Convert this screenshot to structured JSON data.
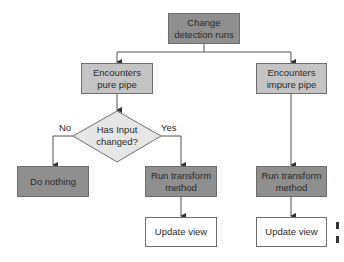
{
  "diagram": {
    "type": "flowchart",
    "nodes": {
      "start": {
        "label": "Change\ndetection runs",
        "line1": "Change",
        "line2": "detection runs",
        "shape": "rect",
        "fill": "#8f8f8f"
      },
      "pure": {
        "line1": "Encounters",
        "line2": "pure pipe",
        "shape": "rect",
        "fill": "#c4c4c4"
      },
      "impure": {
        "line1": "Encounters",
        "line2": "impure pipe",
        "shape": "rect",
        "fill": "#c4c4c4"
      },
      "decision": {
        "line1": "Has Input",
        "line2": "changed?",
        "shape": "diamond",
        "fill": "#e6e6e6"
      },
      "do_nothing": {
        "label": "Do nothing",
        "shape": "rect",
        "fill": "#8f8f8f"
      },
      "transform_pure": {
        "line1": "Run transform",
        "line2": "method",
        "shape": "rect",
        "fill": "#8f8f8f"
      },
      "update_pure": {
        "label": "Update view",
        "shape": "rect",
        "fill": "#ffffff"
      },
      "transform_impure": {
        "line1": "Run transform",
        "line2": "method",
        "shape": "rect",
        "fill": "#8f8f8f"
      },
      "update_impure": {
        "label": "Update view",
        "shape": "rect",
        "fill": "#ffffff"
      }
    },
    "edge_labels": {
      "no": "No",
      "yes": "Yes"
    },
    "edges": [
      {
        "from": "start",
        "to": "pure"
      },
      {
        "from": "start",
        "to": "impure"
      },
      {
        "from": "pure",
        "to": "decision"
      },
      {
        "from": "decision",
        "to": "do_nothing",
        "label": "No"
      },
      {
        "from": "decision",
        "to": "transform_pure",
        "label": "Yes"
      },
      {
        "from": "transform_pure",
        "to": "update_pure"
      },
      {
        "from": "impure",
        "to": "transform_impure"
      },
      {
        "from": "transform_impure",
        "to": "update_impure"
      }
    ]
  }
}
